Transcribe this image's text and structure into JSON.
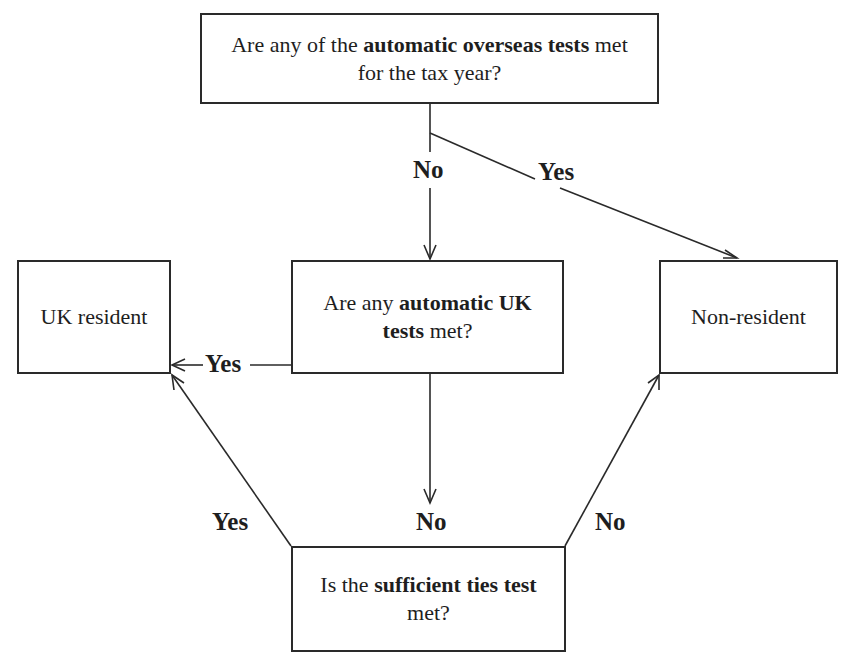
{
  "diagram": {
    "type": "flowchart",
    "nodes": {
      "start": {
        "text_before": "Are any of the ",
        "text_bold": "automatic overseas tests",
        "text_after": " met",
        "line2": "for the tax year?"
      },
      "uk_test": {
        "text_before": "Are any ",
        "text_bold": "automatic UK",
        "line2_bold": "tests",
        "line2_after": " met?"
      },
      "uk_resident": {
        "text": "UK resident"
      },
      "non_resident": {
        "text": "Non-resident"
      },
      "ties_test": {
        "text_before": "Is the ",
        "text_bold": "sufficient ties test",
        "line2": "met?"
      }
    },
    "edges": [
      {
        "from": "start",
        "to": "uk_test",
        "label": "No"
      },
      {
        "from": "start",
        "to": "non_resident",
        "label": "Yes"
      },
      {
        "from": "uk_test",
        "to": "uk_resident",
        "label": "Yes"
      },
      {
        "from": "uk_test",
        "to": "ties_test",
        "label": "No"
      },
      {
        "from": "ties_test",
        "to": "uk_resident",
        "label": "Yes"
      },
      {
        "from": "ties_test",
        "to": "non_resident",
        "label": "No"
      }
    ],
    "colors": {
      "line": "#2a2a2a",
      "background": "#ffffff",
      "text": "#1e1e1e"
    }
  }
}
